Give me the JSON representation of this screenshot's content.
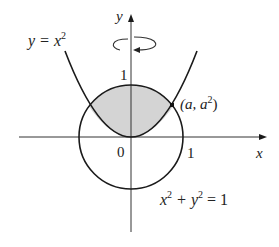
{
  "figure": {
    "type": "diagram",
    "labels": {
      "y_axis": "y",
      "x_axis": "x",
      "parabola_lhs": "y = x",
      "parabola_exp": "2",
      "circle_x": "x",
      "circle_plus": " + y",
      "circle_exp": "2",
      "circle_rhs": " = 1",
      "point_open": "(a, a",
      "point_exp": "2",
      "point_close": ")",
      "tick_y1": "1",
      "tick_x1": "1",
      "origin": "0"
    },
    "colors": {
      "stroke": "#1a1a1a",
      "shade": "#d4d4d4",
      "background": "#ffffff"
    },
    "annotations": {
      "rotation_arrow": "rotation about y-axis"
    }
  }
}
